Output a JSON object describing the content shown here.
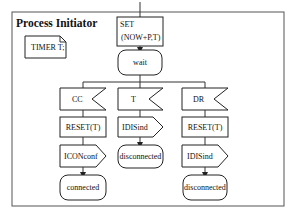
{
  "diagram": {
    "title": "Process Initiator",
    "declaration": "TIMER T;",
    "task_set": {
      "line1": "SET",
      "line2": "(NOW+P,T)"
    },
    "state_wait": "wait",
    "branches": [
      {
        "input": "CC",
        "task": "RESET(T)",
        "output": "ICONconf",
        "next_state": "connected"
      },
      {
        "input": "T",
        "output": "IDISind",
        "next_state": "disconnected"
      },
      {
        "input": "DR",
        "task": "RESET(T)",
        "output": "IDISind",
        "next_state": "disconnected"
      }
    ]
  }
}
